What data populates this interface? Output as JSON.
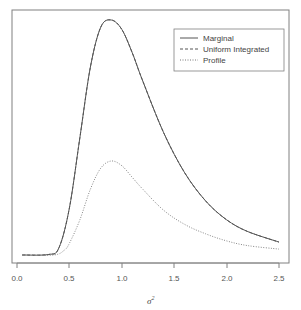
{
  "chart_data": {
    "type": "line",
    "title": "",
    "xlabel": "σ²",
    "ylabel": "",
    "xlim": [
      0.05,
      2.5
    ],
    "x_ticks": [
      "0.0",
      "0.5",
      "1.0",
      "1.5",
      "2.0",
      "2.5"
    ],
    "y_ticks": [],
    "grid": false,
    "legend_position": "top-right",
    "legend": [
      "Marginal",
      "Uniform Integrated",
      "Profile"
    ],
    "series": [
      {
        "name": "Marginal",
        "style": "solid",
        "peak_x": 0.91,
        "peak_rel_height": 1.0,
        "x": [
          0.05,
          0.3,
          0.4,
          0.5,
          0.6,
          0.7,
          0.8,
          0.9,
          1.0,
          1.1,
          1.2,
          1.4,
          1.6,
          1.8,
          2.0,
          2.2,
          2.5
        ],
        "y": [
          0,
          0.002,
          0.03,
          0.2,
          0.5,
          0.8,
          0.97,
          1.0,
          0.96,
          0.86,
          0.74,
          0.52,
          0.35,
          0.23,
          0.15,
          0.1,
          0.055
        ]
      },
      {
        "name": "Uniform Integrated",
        "style": "dashed",
        "note": "overlaps Marginal curve",
        "x": [
          0.05,
          0.3,
          0.4,
          0.5,
          0.6,
          0.7,
          0.8,
          0.9,
          1.0,
          1.1,
          1.2,
          1.4,
          1.6,
          1.8,
          2.0,
          2.2,
          2.5
        ],
        "y": [
          0,
          0.002,
          0.03,
          0.2,
          0.5,
          0.8,
          0.97,
          1.0,
          0.96,
          0.86,
          0.74,
          0.52,
          0.35,
          0.23,
          0.15,
          0.1,
          0.055
        ]
      },
      {
        "name": "Profile",
        "style": "dotted",
        "peak_x": 0.89,
        "peak_rel_height": 0.4,
        "x": [
          0.05,
          0.35,
          0.45,
          0.5,
          0.6,
          0.7,
          0.8,
          0.9,
          1.0,
          1.1,
          1.2,
          1.4,
          1.6,
          1.8,
          2.0,
          2.2,
          2.5
        ],
        "y": [
          0,
          0.0,
          0.02,
          0.05,
          0.15,
          0.28,
          0.37,
          0.4,
          0.38,
          0.33,
          0.28,
          0.19,
          0.13,
          0.09,
          0.06,
          0.04,
          0.025
        ]
      }
    ]
  },
  "legend": {
    "items": [
      {
        "label": "Marginal",
        "style": "solid"
      },
      {
        "label": "Uniform Integrated",
        "style": "dashed"
      },
      {
        "label": "Profile",
        "style": "dotted"
      }
    ]
  },
  "axis": {
    "xlabel_base": "σ",
    "xlabel_sup": "2",
    "ticks": [
      "0.0",
      "0.5",
      "1.0",
      "1.5",
      "2.0",
      "2.5"
    ]
  },
  "colors": {
    "line": "#555555",
    "frame": "#777777"
  }
}
